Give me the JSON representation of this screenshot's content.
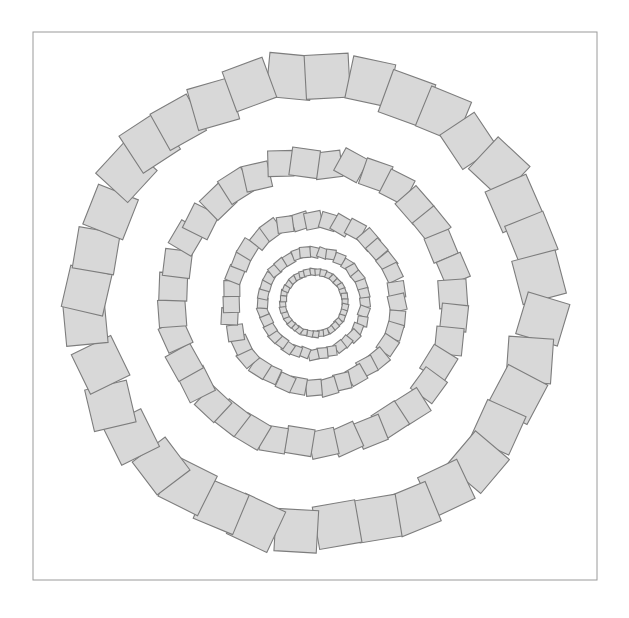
{
  "canvas": {
    "width": 629,
    "height": 618,
    "background_color": "#ffffff",
    "title": "Concentric rings of rotated squares"
  },
  "frame": {
    "name": "outer-border-frame",
    "x": 33,
    "y": 32,
    "width": 564,
    "height": 548,
    "stroke_color": "#9a9a9a",
    "stroke_width": 1,
    "fill": "none"
  },
  "figure": {
    "center_x": 314,
    "center_y": 303,
    "square_fill_color": "#d8d8d8",
    "square_stroke_color": "#7d7d7d",
    "square_stroke_width": 1.1,
    "ring_count": 5
  },
  "chart_data": {
    "type": "scatter",
    "subtitle": "",
    "xlabel": "",
    "ylabel": "",
    "grid": false,
    "legend": "none",
    "xlim": [
      0,
      629
    ],
    "ylim": [
      0,
      618
    ],
    "center": [
      314,
      303
    ],
    "marker": "square",
    "fill_color": "#d8d8d8",
    "edge_color": "#7d7d7d",
    "rings": [
      {
        "name": "ring-1-outer",
        "index": 1,
        "radius": 226,
        "square_size": 43,
        "count": 36,
        "start_angle_deg": -96,
        "jitter_seed": 11
      },
      {
        "name": "ring-2",
        "index": 2,
        "radius": 141,
        "square_size": 27,
        "count": 36,
        "start_angle_deg": -84,
        "jitter_seed": 23
      },
      {
        "name": "ring-3",
        "index": 3,
        "radius": 84,
        "square_size": 16.5,
        "count": 36,
        "start_angle_deg": -100,
        "jitter_seed": 37
      },
      {
        "name": "ring-4",
        "index": 4,
        "radius": 51,
        "square_size": 10,
        "count": 36,
        "start_angle_deg": -90,
        "jitter_seed": 53
      },
      {
        "name": "ring-5-inner",
        "index": 5,
        "radius": 31,
        "square_size": 6.2,
        "count": 36,
        "start_angle_deg": -92,
        "jitter_seed": 71
      }
    ]
  }
}
